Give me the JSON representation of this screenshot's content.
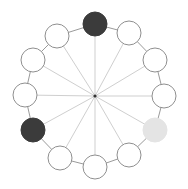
{
  "board": {
    "center": {
      "x": 95,
      "y": 96
    },
    "node_radius": 12,
    "colors": {
      "dark": "#3b3b3b",
      "light": "#e4e4e4",
      "empty": "#ffffff",
      "outline": "#8f8f8f",
      "spoke": "#cfcfcf",
      "ring": "#9a9a9a",
      "hub": "#333333"
    },
    "nodes": [
      {
        "id": 0,
        "x": 95,
        "y": 24,
        "state": "dark"
      },
      {
        "id": 1,
        "x": 129,
        "y": 33,
        "state": "empty"
      },
      {
        "id": 2,
        "x": 155,
        "y": 60,
        "state": "empty"
      },
      {
        "id": 3,
        "x": 164,
        "y": 96,
        "state": "empty"
      },
      {
        "id": 4,
        "x": 155,
        "y": 130,
        "state": "light"
      },
      {
        "id": 5,
        "x": 129,
        "y": 155,
        "state": "empty"
      },
      {
        "id": 6,
        "x": 95,
        "y": 167,
        "state": "empty"
      },
      {
        "id": 7,
        "x": 60,
        "y": 158,
        "state": "empty"
      },
      {
        "id": 8,
        "x": 33,
        "y": 130,
        "state": "dark"
      },
      {
        "id": 9,
        "x": 25,
        "y": 95,
        "state": "empty"
      },
      {
        "id": 10,
        "x": 33,
        "y": 60,
        "state": "empty"
      },
      {
        "id": 11,
        "x": 57,
        "y": 36,
        "state": "empty"
      }
    ]
  }
}
